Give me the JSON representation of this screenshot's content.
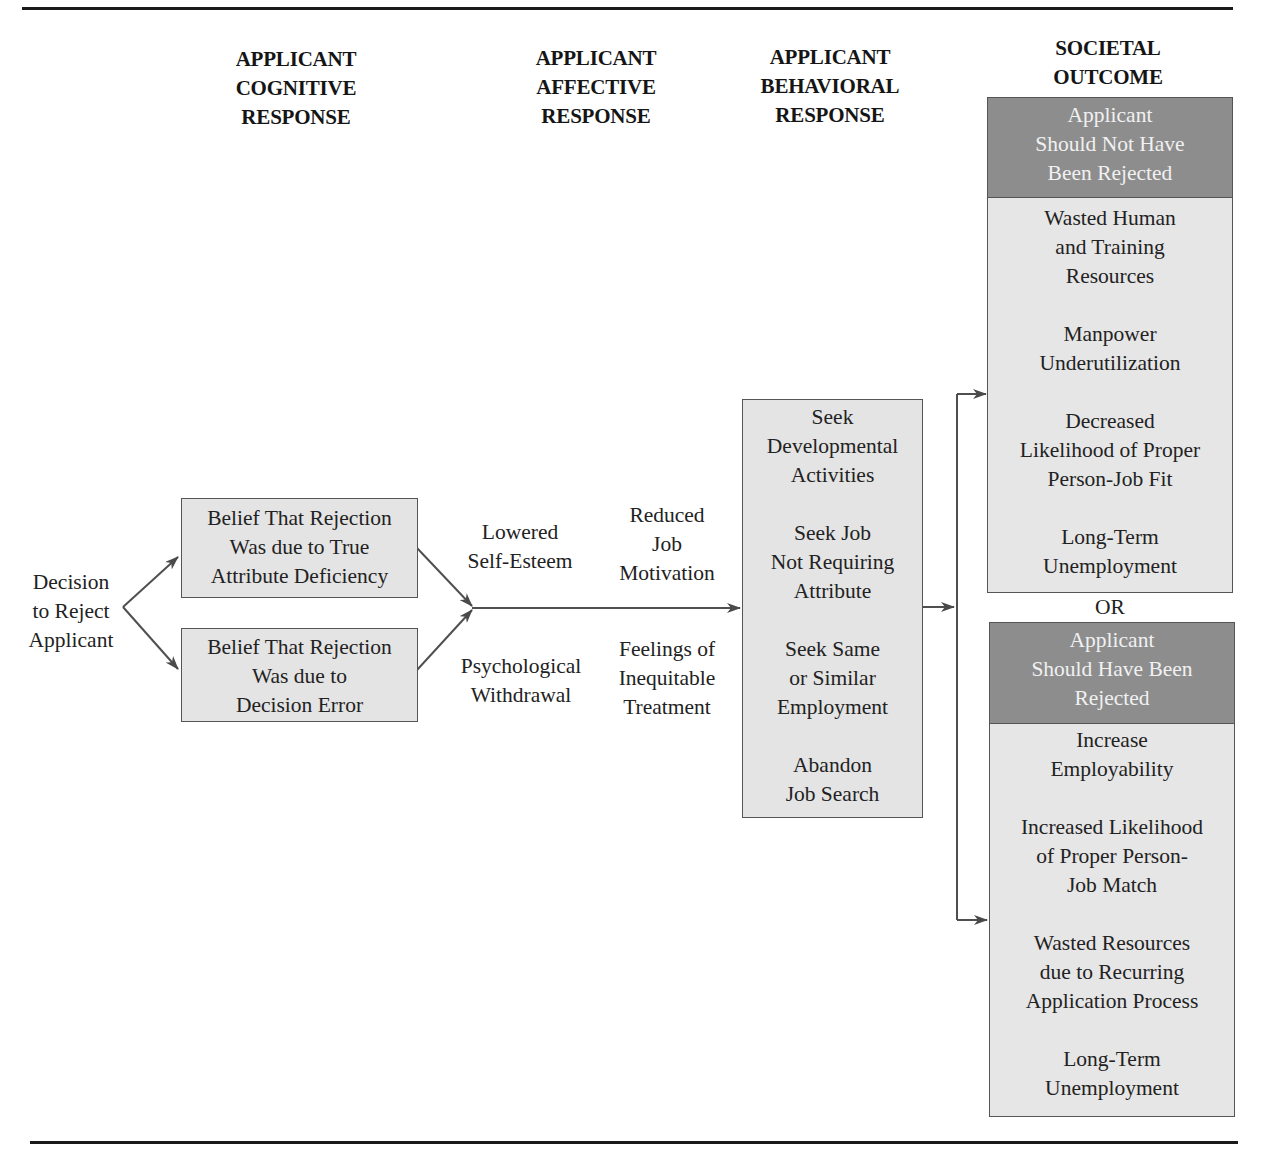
{
  "columns": {
    "cognitive": "APPLICANT\nCOGNITIVE\nRESPONSE",
    "affective": "APPLICANT\nAFFECTIVE\nRESPONSE",
    "behavioral": "APPLICANT\nBEHAVIORAL\nRESPONSE",
    "societal": "SOCIETAL\nOUTCOME"
  },
  "start_node": "Decision\nto Reject\nApplicant",
  "cognitive_boxes": [
    "Belief That Rejection\nWas due to True\nAttribute Deficiency",
    "Belief That Rejection\nWas due to\nDecision Error"
  ],
  "affective_labels": {
    "upper_left": "Lowered\nSelf-Esteem",
    "upper_right": "Reduced\nJob\nMotivation",
    "lower_left": "Psychological\nWithdrawal",
    "lower_right": "Feelings of\nInequitable\nTreatment"
  },
  "behavioral_items": [
    "Seek\nDevelopmental\nActivities",
    "Seek Job\nNot Requiring\nAttribute",
    "Seek Same\nor Similar\nEmployment",
    "Abandon\nJob Search"
  ],
  "outcomes": {
    "separator": "OR",
    "not_rejected": {
      "header": "Applicant\nShould Not Have\nBeen Rejected",
      "items": [
        "Wasted Human\nand Training\nResources",
        "Manpower\nUnderutilization",
        "Decreased\nLikelihood of Proper\nPerson-Job Fit",
        "Long-Term\nUnemployment"
      ]
    },
    "rejected": {
      "header": "Applicant\nShould Have Been\nRejected",
      "items": [
        "Increase\nEmployability",
        "Increased Likelihood\nof Proper Person-\nJob Match",
        "Wasted Resources\ndue to Recurring\nApplication Process",
        "Long-Term\nUnemployment"
      ]
    }
  },
  "colors": {
    "box_fill": "#e4e4e4",
    "header_fill": "#8d8d8d",
    "line": "#555555"
  }
}
